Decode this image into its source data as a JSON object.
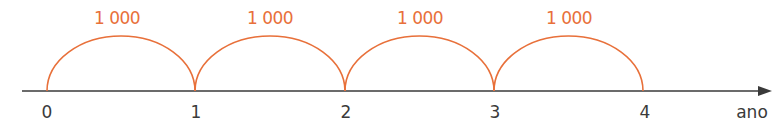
{
  "diagram": {
    "type": "number-line-jumps",
    "axis_label": "ano",
    "ticks": [
      "0",
      "1",
      "2",
      "3",
      "4"
    ],
    "jumps": [
      {
        "from": "0",
        "to": "1",
        "label": "1 000"
      },
      {
        "from": "1",
        "to": "2",
        "label": "1 000"
      },
      {
        "from": "2",
        "to": "3",
        "label": "1 000"
      },
      {
        "from": "3",
        "to": "4",
        "label": "1 000"
      }
    ],
    "colors": {
      "jump": "#e8703a",
      "axis": "#3a3a3a"
    }
  }
}
